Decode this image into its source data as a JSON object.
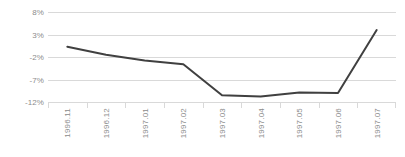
{
  "chart_data": {
    "type": "line",
    "title": "",
    "subtitle": "",
    "xlabel": "",
    "ylabel": "",
    "categories": [
      "1996.11",
      "1996.12",
      "1997.01",
      "1997.02",
      "1997.03",
      "1997.04",
      "1997.05",
      "1997.06",
      "1997.07"
    ],
    "values": [
      0.3,
      -1.5,
      -2.8,
      -3.6,
      -10.5,
      -10.8,
      -9.9,
      -10.0,
      4.0
    ],
    "series": [
      {
        "name": "",
        "values": [
          0.3,
          -1.5,
          -2.8,
          -3.6,
          -10.5,
          -10.8,
          -9.9,
          -10.0,
          4.0
        ]
      }
    ],
    "ylim": [
      -12,
      8
    ],
    "yticks": [
      8,
      3,
      -2,
      -7,
      -12
    ],
    "ytick_labels": [
      "8%",
      "3%",
      "-2%",
      "-7%",
      "-12%"
    ],
    "grid": true,
    "legend": false,
    "legend_position": "none",
    "line_color": "#404040",
    "gridline_color": "#d9d9d9",
    "tick_label_color": "#8c8c8c",
    "background_color": "#ffffff",
    "markers": false,
    "line_width": 2
  }
}
